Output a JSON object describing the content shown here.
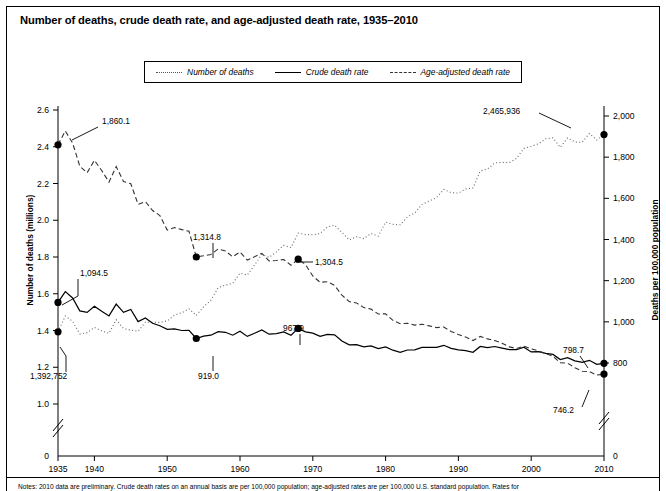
{
  "title": "Number of deaths, crude death rate, and age-adjusted death rate, 1935–2010",
  "legend": {
    "items": [
      {
        "label": "Number of deaths",
        "style": "dotted",
        "icon": "dotted-line-icon"
      },
      {
        "label": "Crude death rate",
        "style": "solid",
        "icon": "solid-line-icon"
      },
      {
        "label": "Age-adjusted death rate",
        "style": "dashed",
        "icon": "dashed-line-icon"
      }
    ]
  },
  "axes": {
    "left_title": "Number of deaths (millions)",
    "right_title": "Deaths per 100,000 population",
    "left_ticks": [
      "2.6",
      "2.4",
      "2.2",
      "2.0",
      "1.8",
      "1.6",
      "1.4",
      "1.2",
      "1.0",
      "0"
    ],
    "right_ticks": [
      "2,000",
      "1,800",
      "1,600",
      "1,400",
      "1,200",
      "1,000",
      "800",
      "0"
    ],
    "x_ticks": [
      "1935",
      "1940",
      "1950",
      "1960",
      "1970",
      "1980",
      "1990",
      "2000",
      "2010"
    ],
    "left_zero_label": "0",
    "right_zero_label": "0",
    "break_marker": "axis-break"
  },
  "footnote": "Notes: 2010 data are preliminary. Crude death rates on an annual basis are per 100,000 population; age-adjusted rates are per 100,000 U.S. standard population. Rates for",
  "annotations": [
    {
      "id": "ann-age-adj-1935",
      "text": "1,860.1",
      "series": "Age-adjusted death rate",
      "year": 1935,
      "value": 1860.1
    },
    {
      "id": "ann-crude-1935",
      "text": "1,094.5",
      "series": "Crude death rate",
      "year": 1935,
      "value": 1094.5
    },
    {
      "id": "ann-deaths-1935",
      "text": "1,392,752",
      "series": "Number of deaths",
      "year": 1935,
      "value": 1392752
    },
    {
      "id": "ann-age-adj-1954",
      "text": "1,314.8",
      "series": "Age-adjusted death rate",
      "year": 1954,
      "value": 1314.8
    },
    {
      "id": "ann-deaths-1954",
      "text": "919.0",
      "series": "Crude death rate",
      "year": 1954,
      "value": 919.0
    },
    {
      "id": "ann-age-adj-1968",
      "text": "1,304.5",
      "series": "Age-adjusted death rate",
      "year": 1968,
      "value": 1304.5
    },
    {
      "id": "ann-crude-1968",
      "text": "967.9",
      "series": "Crude death rate",
      "year": 1968,
      "value": 967.9
    },
    {
      "id": "ann-deaths-2010",
      "text": "2,465,936",
      "series": "Number of deaths",
      "year": 2010,
      "value": 2465936
    },
    {
      "id": "ann-crude-2010",
      "text": "798.7",
      "series": "Crude death rate",
      "year": 2010,
      "value": 798.7
    },
    {
      "id": "ann-age-adj-2010",
      "text": "746.2",
      "series": "Age-adjusted death rate",
      "year": 2010,
      "value": 746.2
    }
  ],
  "chart_data": {
    "type": "line",
    "title": "Number of deaths, crude death rate, and age-adjusted death rate, 1935–2010",
    "xlabel": "",
    "ylabel": "Number of deaths (millions)",
    "y2label": "Deaths per 100,000 population",
    "xlim": [
      1935,
      2010
    ],
    "ylim": [
      0.9,
      2.6
    ],
    "y2lim": [
      700,
      2000
    ],
    "grid": false,
    "legend_position": "top-center",
    "x": [
      1935,
      1936,
      1937,
      1938,
      1939,
      1940,
      1941,
      1942,
      1943,
      1944,
      1945,
      1946,
      1947,
      1948,
      1949,
      1950,
      1951,
      1952,
      1953,
      1954,
      1955,
      1956,
      1957,
      1958,
      1959,
      1960,
      1961,
      1962,
      1963,
      1964,
      1965,
      1966,
      1967,
      1968,
      1969,
      1970,
      1971,
      1972,
      1973,
      1974,
      1975,
      1976,
      1977,
      1978,
      1979,
      1980,
      1981,
      1982,
      1983,
      1984,
      1985,
      1986,
      1987,
      1988,
      1989,
      1990,
      1991,
      1992,
      1993,
      1994,
      1995,
      1996,
      1997,
      1998,
      1999,
      2000,
      2001,
      2002,
      2003,
      2004,
      2005,
      2006,
      2007,
      2008,
      2009,
      2010
    ],
    "series": [
      {
        "name": "Number of deaths",
        "unit": "millions",
        "axis": "left",
        "style": "dotted",
        "values": [
          1.393,
          1.479,
          1.45,
          1.381,
          1.388,
          1.417,
          1.398,
          1.385,
          1.459,
          1.411,
          1.402,
          1.396,
          1.445,
          1.444,
          1.444,
          1.452,
          1.483,
          1.497,
          1.518,
          1.482,
          1.529,
          1.565,
          1.633,
          1.647,
          1.657,
          1.712,
          1.702,
          1.757,
          1.814,
          1.798,
          1.828,
          1.863,
          1.851,
          1.93,
          1.922,
          1.921,
          1.928,
          1.964,
          1.973,
          1.934,
          1.893,
          1.91,
          1.9,
          1.928,
          1.914,
          1.99,
          1.978,
          1.975,
          2.019,
          2.039,
          2.086,
          2.105,
          2.123,
          2.168,
          2.15,
          2.148,
          2.17,
          2.176,
          2.268,
          2.279,
          2.312,
          2.315,
          2.314,
          2.337,
          2.391,
          2.403,
          2.416,
          2.443,
          2.448,
          2.397,
          2.448,
          2.426,
          2.424,
          2.472,
          2.437,
          2.466
        ]
      },
      {
        "name": "Crude death rate",
        "unit": "per 100,000 population",
        "axis": "right",
        "style": "solid",
        "values": [
          1094.5,
          1147.0,
          1116.0,
          1053.0,
          1046.0,
          1076.0,
          1051.0,
          1029.0,
          1086.0,
          1046.0,
          1060.0,
          1001.0,
          1019.0,
          993.0,
          981.0,
          963.8,
          966.0,
          958.0,
          959.0,
          919.0,
          930.0,
          935.0,
          952.0,
          949.0,
          935.0,
          954.7,
          929.0,
          945.0,
          961.0,
          940.0,
          943.0,
          951.0,
          935.0,
          967.9,
          951.0,
          945.3,
          929.0,
          939.0,
          937.0,
          907.0,
          888.5,
          889.0,
          878.0,
          883.0,
          870.0,
          878.3,
          862.0,
          852.0,
          863.0,
          864.0,
          876.0,
          876.0,
          876.0,
          886.0,
          871.0,
          863.8,
          860.0,
          852.0,
          880.0,
          875.0,
          880.0,
          872.5,
          864.7,
          864.7,
          877.0,
          854.0,
          855.0,
          847.3,
          841.9,
          816.5,
          825.9,
          810.4,
          803.6,
          813.0,
          793.8,
          798.7
        ]
      },
      {
        "name": "Age-adjusted death rate",
        "unit": "per 100,000 U.S. standard population",
        "axis": "right",
        "style": "dashed",
        "values": [
          1860.1,
          1927.0,
          1869.0,
          1756.0,
          1724.0,
          1785.0,
          1735.0,
          1679.0,
          1754.0,
          1682.0,
          1671.0,
          1571.0,
          1584.0,
          1541.0,
          1516.0,
          1446.0,
          1458.0,
          1448.0,
          1440.0,
          1314.8,
          1321.0,
          1327.0,
          1354.0,
          1344.0,
          1316.0,
          1339.2,
          1300.0,
          1316.0,
          1333.0,
          1296.0,
          1298.0,
          1303.0,
          1275.0,
          1304.5,
          1278.0,
          1222.6,
          1192.0,
          1195.0,
          1177.0,
          1130.0,
          1098.3,
          1092.0,
          1069.0,
          1062.0,
          1038.0,
          1039.1,
          1007.0,
          991.0,
          993.0,
          984.0,
          988.0,
          980.0,
          972.0,
          975.0,
          953.0,
          938.7,
          926.0,
          909.0,
          929.0,
          917.0,
          909.0,
          896.0,
          878.1,
          870.6,
          881.9,
          869.0,
          858.8,
          845.3,
          832.7,
          800.8,
          798.8,
          776.5,
          760.2,
          758.3,
          741.1,
          746.2
        ]
      }
    ],
    "markers": [
      {
        "series": "Age-adjusted death rate",
        "year": 1935,
        "value": 1860.1,
        "label": "1,860.1"
      },
      {
        "series": "Crude death rate",
        "year": 1935,
        "value": 1094.5,
        "label": "1,094.5"
      },
      {
        "series": "Number of deaths",
        "year": 1935,
        "value": 1392752,
        "label": "1,392,752"
      },
      {
        "series": "Age-adjusted death rate",
        "year": 1954,
        "value": 1314.8,
        "label": "1,314.8"
      },
      {
        "series": "Crude death rate",
        "year": 1954,
        "value": 919.0,
        "label": "919.0"
      },
      {
        "series": "Age-adjusted death rate",
        "year": 1968,
        "value": 1304.5,
        "label": "1,304.5"
      },
      {
        "series": "Crude death rate",
        "year": 1968,
        "value": 967.9,
        "label": "967.9"
      },
      {
        "series": "Number of deaths",
        "year": 2010,
        "value": 2465936,
        "label": "2,465,936"
      },
      {
        "series": "Crude death rate",
        "year": 2010,
        "value": 798.7,
        "label": "798.7"
      },
      {
        "series": "Age-adjusted death rate",
        "year": 2010,
        "value": 746.2,
        "label": "746.2"
      }
    ]
  }
}
